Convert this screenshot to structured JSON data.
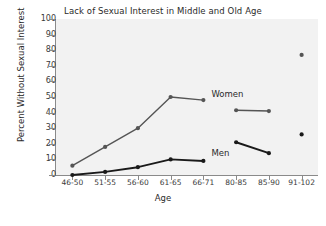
{
  "chart_data": {
    "type": "line",
    "title": "Lack of Sexual Interest in Middle and Old Age",
    "xlabel": "Age",
    "ylabel": "Percent Without Sexual Interest",
    "categories": [
      "46-50",
      "51-55",
      "56-60",
      "61-65",
      "66-71",
      "80-85",
      "85-90",
      "91-102"
    ],
    "ylim": [
      0,
      100
    ],
    "ytick_labels": [
      "0",
      "10",
      "20",
      "30",
      "40",
      "50",
      "60",
      "70",
      "80",
      "90",
      "100"
    ],
    "ytick_values": [
      0,
      10,
      20,
      30,
      40,
      50,
      60,
      70,
      80,
      90,
      100
    ],
    "grid": false,
    "legend_position": "inline-annotations",
    "series": [
      {
        "name": "Women",
        "color": "#555555",
        "values": [
          6,
          18,
          30,
          50,
          48,
          41.5,
          41,
          77
        ],
        "segments": [
          [
            0,
            1,
            2,
            3,
            4
          ],
          [
            5,
            6
          ],
          [
            7
          ]
        ]
      },
      {
        "name": "Men",
        "color": "#1a1a1a",
        "values": [
          0,
          2,
          5,
          10,
          9,
          21,
          14,
          26
        ],
        "segments": [
          [
            0,
            1,
            2,
            3,
            4
          ],
          [
            5,
            6
          ],
          [
            7
          ]
        ]
      }
    ],
    "annotations": [
      {
        "text": "Women",
        "x_category": "66-71",
        "y_value": 49
      },
      {
        "text": "Men",
        "x_category": "66-71",
        "y_value": 11
      }
    ]
  },
  "colors": {
    "plot_background": "#f2f2f2",
    "figure_background": "#ffffff",
    "axis": "#8a8a8a",
    "women_series": "#555555",
    "men_series": "#1a1a1a",
    "text": "#2a2a2a"
  }
}
